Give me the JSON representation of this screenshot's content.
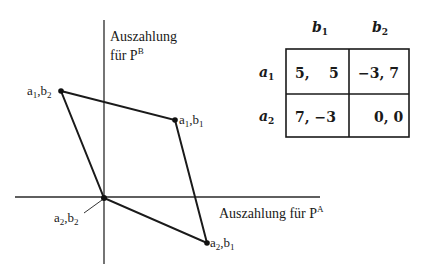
{
  "diagram": {
    "y_axis_label": {
      "line1": "Auszahlung",
      "line2_prefix": "für P",
      "line2_sup": "B"
    },
    "x_axis_label": {
      "prefix": "Auszahlung für P",
      "sup": "A"
    },
    "points": [
      {
        "id": "a1b2",
        "a": "a",
        "a_sub": "1",
        "b": "b",
        "b_sub": "2",
        "payoff": [
          -3,
          7
        ]
      },
      {
        "id": "a1b1",
        "a": "a",
        "a_sub": "1",
        "b": "b",
        "b_sub": "1",
        "payoff": [
          5,
          5
        ]
      },
      {
        "id": "a2b2",
        "a": "a",
        "a_sub": "2",
        "b": "b",
        "b_sub": "2",
        "payoff": [
          0,
          0
        ]
      },
      {
        "id": "a2b1",
        "a": "a",
        "a_sub": "2",
        "b": "b",
        "b_sub": "1",
        "payoff": [
          7,
          -3
        ]
      }
    ],
    "line_color": "#1a1a1a"
  },
  "payoff_matrix": {
    "col_headers": [
      {
        "base": "b",
        "sub": "1"
      },
      {
        "base": "b",
        "sub": "2"
      }
    ],
    "row_headers": [
      {
        "base": "a",
        "sub": "1"
      },
      {
        "base": "a",
        "sub": "2"
      }
    ],
    "cells": [
      [
        "5,    5",
        "−3, 7"
      ],
      [
        "7, −3",
        "0, 0"
      ]
    ]
  }
}
